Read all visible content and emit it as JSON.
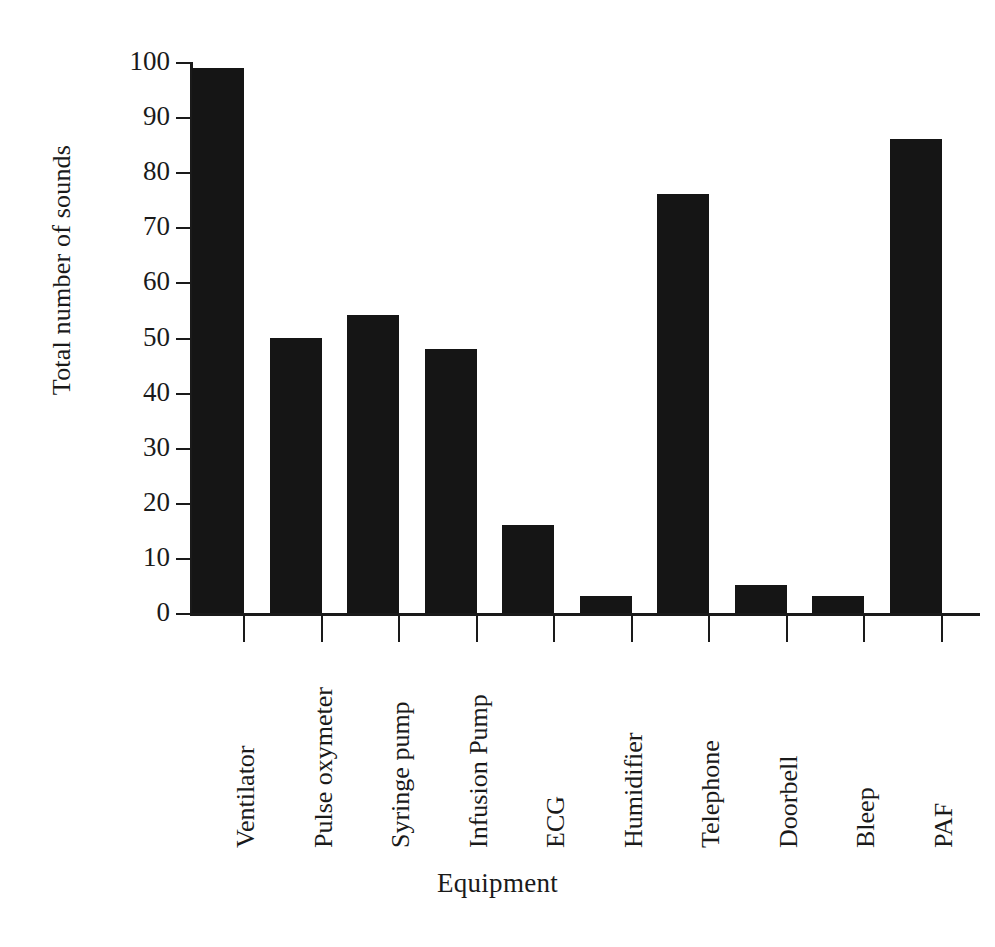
{
  "chart_data": {
    "type": "bar",
    "title": "",
    "xlabel": "Equipment",
    "ylabel": "Total number of sounds",
    "categories": [
      "Ventilator",
      "Pulse oxymeter",
      "Syringe pump",
      "Infusion Pump",
      "ECG",
      "Humidifier",
      "Telephone",
      "Doorbell",
      "Bleep",
      "PAF"
    ],
    "values": [
      99,
      50,
      54,
      48,
      16,
      3,
      76,
      5,
      3,
      86
    ],
    "ylim": [
      0,
      100
    ],
    "yticks": [
      0,
      10,
      20,
      30,
      40,
      50,
      60,
      70,
      80,
      90,
      100
    ],
    "ytick_labels": [
      "0",
      "10",
      "20",
      "30",
      "40",
      "50",
      "60",
      "70",
      "80",
      "90",
      "100"
    ],
    "grid": false,
    "legend": false,
    "bar_color": "#151515",
    "axis_color": "#1a1a1a",
    "background": "#ffffff"
  }
}
